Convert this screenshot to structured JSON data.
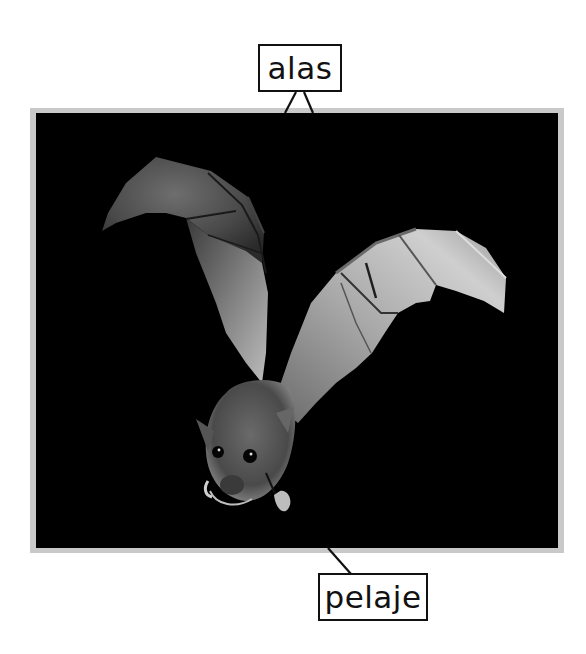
{
  "diagram": {
    "labels": [
      {
        "id": "alas",
        "text": "alas",
        "points_to": "wings"
      },
      {
        "id": "pelaje",
        "text": "pelaje",
        "points_to": "fur"
      }
    ]
  },
  "colors": {
    "frame": "#c9c9c9",
    "photo_background": "#000000",
    "label_border": "#111111",
    "label_text": "#111111"
  }
}
